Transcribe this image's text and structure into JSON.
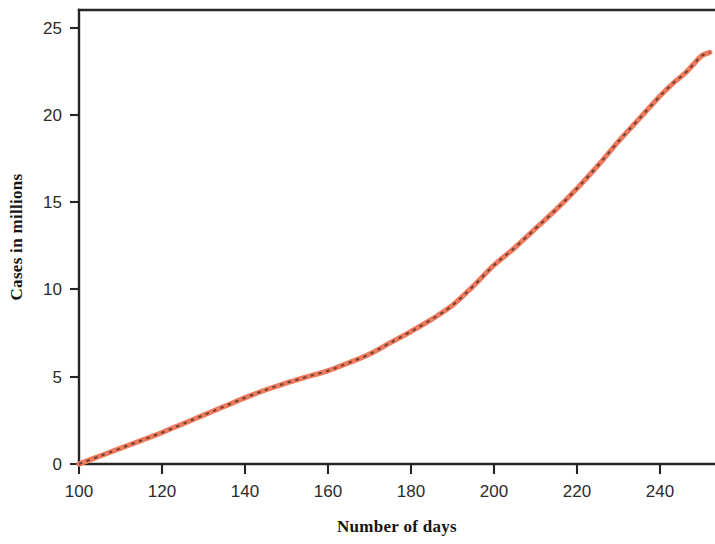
{
  "chart_data": {
    "type": "line",
    "title": "",
    "subtitle": "",
    "xlabel": "Number of days",
    "ylabel": "Cases in millions",
    "xlim": [
      100,
      253
    ],
    "ylim": [
      0,
      26
    ],
    "grid": false,
    "legend": null,
    "x_ticks": [
      100,
      120,
      140,
      160,
      180,
      200,
      220,
      240
    ],
    "x_tick_labels": [
      "100",
      "120",
      "140",
      "160",
      "180",
      "200",
      "220",
      "240"
    ],
    "y_ticks": [
      0,
      5,
      10,
      15,
      20,
      25
    ],
    "y_tick_labels": [
      "0",
      "5",
      "10",
      "15",
      "20",
      "25"
    ],
    "series": [
      {
        "name": "Cumulative cases",
        "line_color": "#ef7b5e",
        "marker_color": "#3a2a22",
        "style": "solid-with-dashed-overlay",
        "x": [
          100,
          105,
          110,
          115,
          120,
          125,
          130,
          135,
          140,
          145,
          150,
          155,
          160,
          165,
          170,
          175,
          180,
          185,
          190,
          195,
          200,
          205,
          210,
          215,
          220,
          225,
          230,
          235,
          240,
          243,
          246,
          248,
          250,
          252
        ],
        "values": [
          0.0,
          0.45,
          0.9,
          1.35,
          1.8,
          2.3,
          2.8,
          3.3,
          3.8,
          4.25,
          4.65,
          5.0,
          5.35,
          5.8,
          6.3,
          6.95,
          7.6,
          8.3,
          9.1,
          10.2,
          11.4,
          12.4,
          13.5,
          14.6,
          15.8,
          17.1,
          18.5,
          19.8,
          21.1,
          21.8,
          22.4,
          22.9,
          23.4,
          23.6
        ]
      }
    ]
  },
  "axes": {
    "x_axis_label": "Number of days",
    "y_axis_label": "Cases in millions"
  },
  "colors": {
    "line": "#ef7b5e",
    "dash_overlay": "#3a2a22",
    "axis": "#252525",
    "background": "#ffffff",
    "tick_text": "#2b2b2b"
  }
}
